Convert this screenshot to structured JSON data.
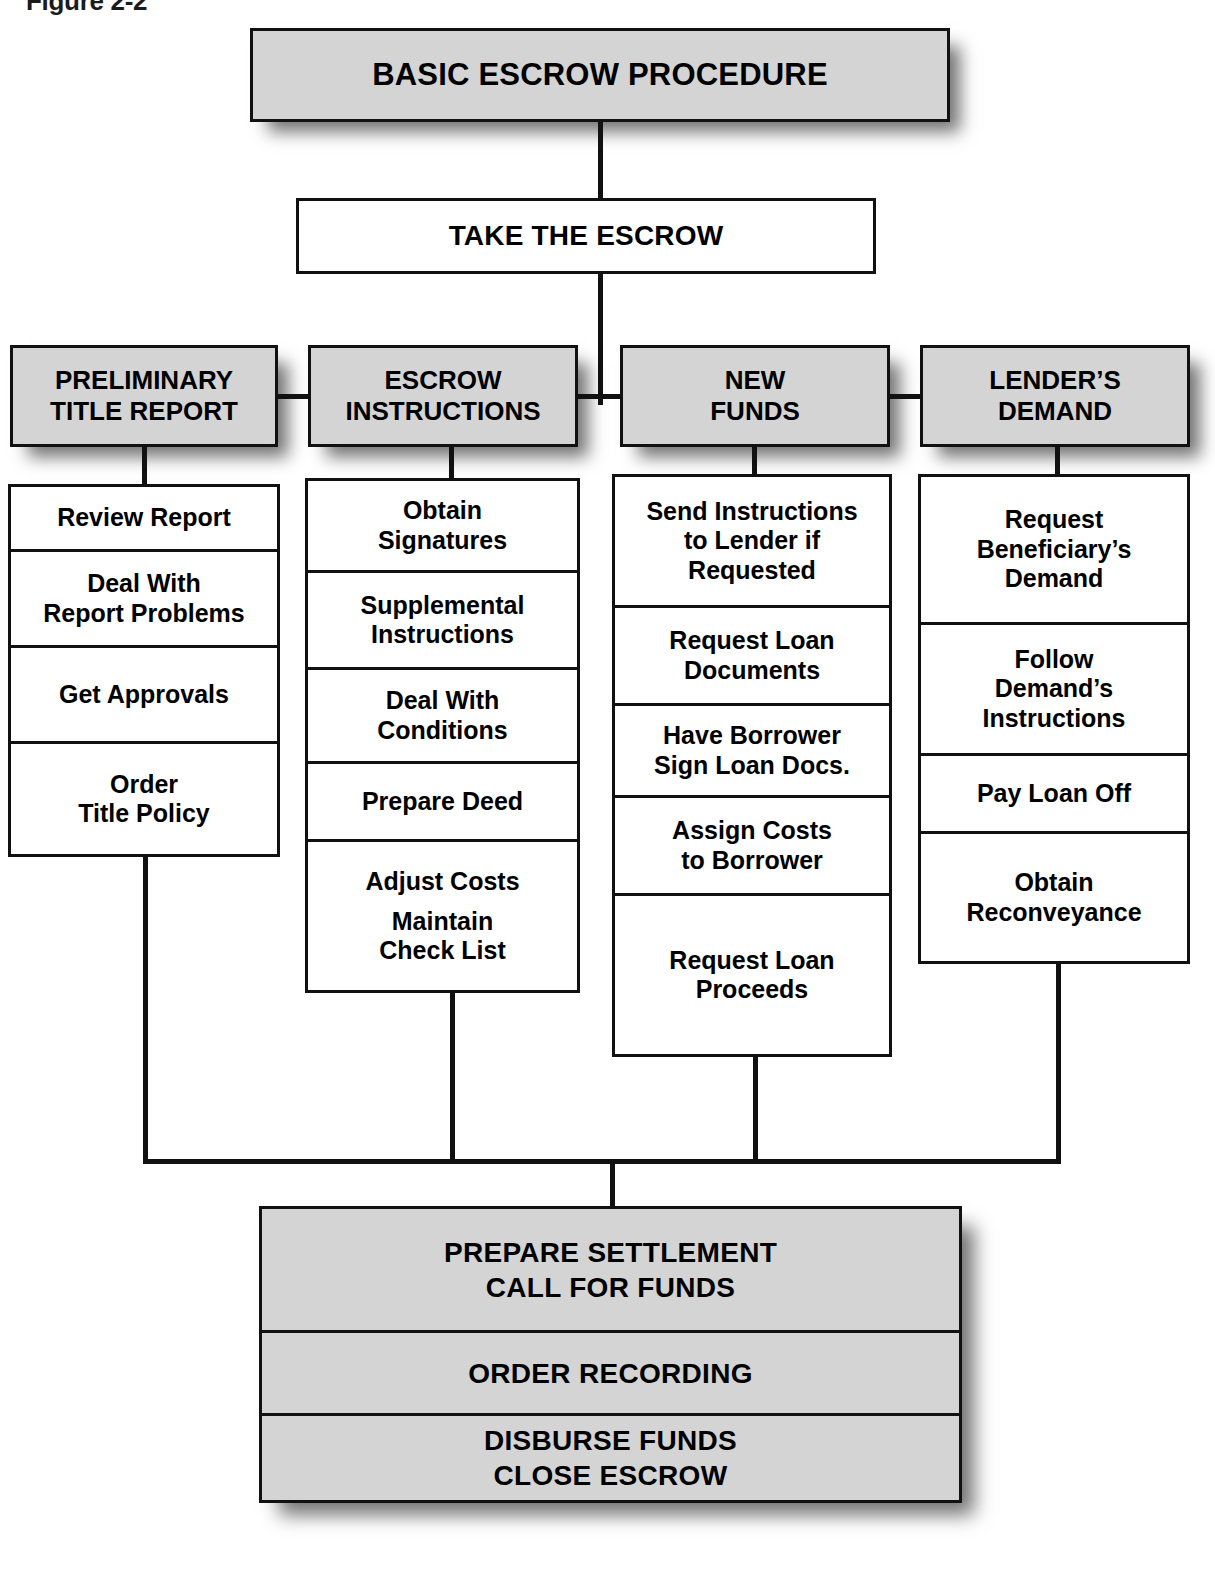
{
  "figure": {
    "label": "Figure 2-2"
  },
  "title_box": {
    "label": "BASIC ESCROW PROCEDURE"
  },
  "second_box": {
    "label": "TAKE THE ESCROW"
  },
  "columns": [
    {
      "header_line1": "PRELIMINARY",
      "header_line2": "TITLE REPORT",
      "items": [
        {
          "line1": "Review Report",
          "line2": "",
          "line3": ""
        },
        {
          "line1": "Deal With",
          "line2": "Report Problems",
          "line3": ""
        },
        {
          "line1": "Get Approvals",
          "line2": "",
          "line3": ""
        },
        {
          "line1": "Order",
          "line2": "Title Policy",
          "line3": ""
        }
      ]
    },
    {
      "header_line1": "ESCROW",
      "header_line2": "INSTRUCTIONS",
      "items": [
        {
          "line1": "Obtain",
          "line2": "Signatures",
          "line3": ""
        },
        {
          "line1": "Supplemental",
          "line2": "Instructions",
          "line3": ""
        },
        {
          "line1": "Deal With",
          "line2": "Conditions",
          "line3": ""
        },
        {
          "line1": "Prepare Deed",
          "line2": "",
          "line3": ""
        },
        {
          "line1": "Adjust Costs",
          "line2": "Maintain",
          "line3": "Check List"
        }
      ]
    },
    {
      "header_line1": "NEW",
      "header_line2": "FUNDS",
      "items": [
        {
          "line1": "Send Instructions",
          "line2": "to Lender if",
          "line3": "Requested"
        },
        {
          "line1": "Request Loan",
          "line2": "Documents",
          "line3": ""
        },
        {
          "line1": "Have Borrower",
          "line2": "Sign Loan Docs.",
          "line3": ""
        },
        {
          "line1": "Assign Costs",
          "line2": "to Borrower",
          "line3": ""
        },
        {
          "line1": "Request Loan",
          "line2": "Proceeds",
          "line3": ""
        }
      ]
    },
    {
      "header_line1": "LENDER’S",
      "header_line2": "DEMAND",
      "items": [
        {
          "line1": "Request",
          "line2": "Beneficiary’s",
          "line3": "Demand"
        },
        {
          "line1": "Follow",
          "line2": "Demand’s",
          "line3": "Instructions"
        },
        {
          "line1": "Pay Loan Off",
          "line2": "",
          "line3": ""
        },
        {
          "line1": "Obtain",
          "line2": "Reconveyance",
          "line3": ""
        }
      ]
    }
  ],
  "bottom_box": {
    "rows": [
      {
        "line1": "PREPARE SETTLEMENT",
        "line2": "CALL FOR FUNDS"
      },
      {
        "line1": "ORDER RECORDING",
        "line2": ""
      },
      {
        "line1": "DISBURSE FUNDS",
        "line2": "CLOSE ESCROW"
      }
    ]
  },
  "colors": {
    "shaded_fill": "#d4d4d4",
    "line": "#111111",
    "text": "#000000",
    "page": "#ffffff"
  }
}
